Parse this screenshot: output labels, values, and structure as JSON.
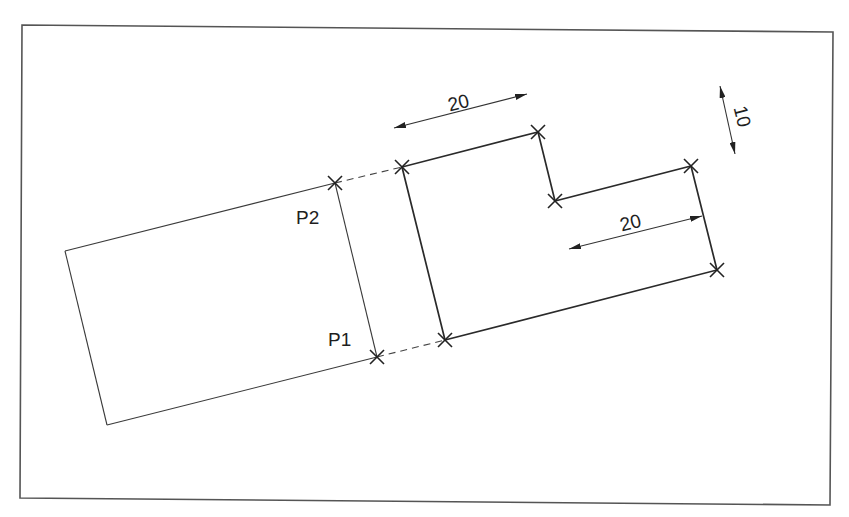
{
  "diagram": {
    "type": "cad-stretch-illustration",
    "colors": {
      "background": "#ffffff",
      "lines": "#2a2a2a",
      "frame": "#555555",
      "text": "#1e1e1e"
    },
    "points": {
      "p1": {
        "label": "P1"
      },
      "p2": {
        "label": "P2"
      }
    },
    "dimensions": {
      "top_length": {
        "value": "20"
      },
      "right_length": {
        "value": "20"
      },
      "step_height": {
        "value": "10"
      }
    }
  }
}
